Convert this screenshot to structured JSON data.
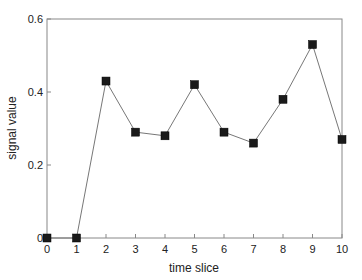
{
  "chart_data": {
    "type": "line",
    "title": "",
    "xlabel": "time slice",
    "ylabel": "signal value",
    "x": [
      0,
      1,
      2,
      3,
      4,
      5,
      6,
      7,
      8,
      9,
      10
    ],
    "series": [
      {
        "name": "signal",
        "values": [
          0,
          0,
          0.43,
          0.29,
          0.28,
          0.42,
          0.29,
          0.26,
          0.38,
          0.53,
          0.27
        ],
        "marker": "square",
        "marker_color": "#1a1a1a",
        "line_color": "#777777"
      }
    ],
    "xlim": [
      0,
      10
    ],
    "ylim": [
      0,
      0.6
    ],
    "xticks": [
      "0",
      "1",
      "2",
      "3",
      "4",
      "5",
      "6",
      "7",
      "8",
      "9",
      "10"
    ],
    "yticks": [
      "0",
      "0.2",
      "0.4",
      "0.6"
    ],
    "ytick_values": [
      0,
      0.2,
      0.4,
      0.6
    ],
    "grid": false,
    "legend": null
  }
}
